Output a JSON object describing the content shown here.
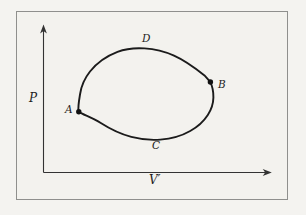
{
  "figure": {
    "type": "pv-cycle-diagram",
    "axes": {
      "y_label": "P",
      "x_label": "V′"
    },
    "points": [
      {
        "id": "A",
        "label": "A",
        "position": "left vertex of loop, marked with dot"
      },
      {
        "id": "B",
        "label": "B",
        "position": "right vertex of loop, marked with dot"
      },
      {
        "id": "C",
        "label": "C",
        "position": "bottom of loop"
      },
      {
        "id": "D",
        "label": "D",
        "position": "top of loop"
      }
    ],
    "colors": {
      "background": "#f3f2ee",
      "frame_border": "#8f8f8d",
      "curve": "#1b1b1b",
      "axis": "#333333",
      "label": "#1d1d1d"
    }
  }
}
